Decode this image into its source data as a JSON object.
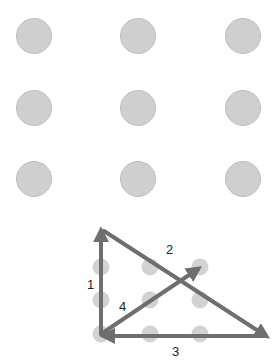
{
  "puzzle": {
    "grid_dots": [
      {
        "x": 34,
        "y": 36
      },
      {
        "x": 138,
        "y": 36
      },
      {
        "x": 243,
        "y": 36
      },
      {
        "x": 34,
        "y": 108
      },
      {
        "x": 138,
        "y": 108
      },
      {
        "x": 243,
        "y": 108
      },
      {
        "x": 34,
        "y": 179
      },
      {
        "x": 138,
        "y": 179
      },
      {
        "x": 243,
        "y": 179
      }
    ],
    "dot_color": "#cfcfcf",
    "dot_stroke": "#bdbdbd"
  },
  "solution": {
    "small_dots": [
      {
        "x": 101,
        "y": 267
      },
      {
        "x": 150,
        "y": 267
      },
      {
        "x": 200,
        "y": 267
      },
      {
        "x": 101,
        "y": 300
      },
      {
        "x": 150,
        "y": 300
      },
      {
        "x": 200,
        "y": 300
      },
      {
        "x": 101,
        "y": 334
      },
      {
        "x": 150,
        "y": 334
      },
      {
        "x": 200,
        "y": 334
      }
    ],
    "line_color": "#6e6e6e",
    "lines": [
      {
        "label": "1",
        "x1": 101,
        "y1": 334,
        "x2": 101,
        "y2": 231
      },
      {
        "label": "2",
        "x1": 104,
        "y1": 231,
        "x2": 266,
        "y2": 336
      },
      {
        "label": "3",
        "x1": 266,
        "y1": 336,
        "x2": 104,
        "y2": 336
      },
      {
        "label": "4",
        "x1": 101,
        "y1": 334,
        "x2": 198,
        "y2": 269
      }
    ],
    "labels": [
      {
        "text": "1",
        "x": 87,
        "y": 289
      },
      {
        "text": "2",
        "x": 166,
        "y": 254
      },
      {
        "text": "3",
        "x": 172,
        "y": 356
      },
      {
        "text": "4",
        "x": 119,
        "y": 311
      }
    ]
  }
}
